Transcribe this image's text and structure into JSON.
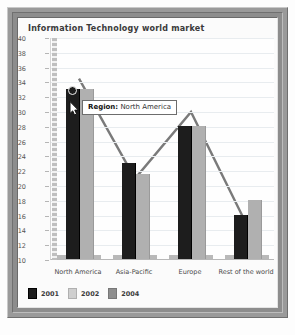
{
  "chart": {
    "title": "Information Technology world market",
    "tooltip": {
      "label": "Region:",
      "value": "North America"
    }
  },
  "legend": {
    "items": [
      {
        "label": "2001",
        "color": "#1d1d1d"
      },
      {
        "label": "2002",
        "color": "#cfcfcf"
      },
      {
        "label": "2004",
        "color": "#8e8e8e"
      }
    ]
  },
  "caption": {
    "text": ""
  },
  "chart_data": {
    "type": "bar",
    "title": "Information Technology world market",
    "xlabel": "",
    "ylabel": "",
    "ylim": [
      10,
      40
    ],
    "yticks": [
      10,
      12,
      14,
      16,
      18,
      20,
      22,
      24,
      26,
      28,
      30,
      32,
      34,
      36,
      38,
      40
    ],
    "grid": true,
    "legend_position": "bottom-left",
    "categories": [
      "North America",
      "Asia-Pacific",
      "Europe",
      "Rest of the world"
    ],
    "series": [
      {
        "name": "2001",
        "type": "bar",
        "color": "#1d1d1d",
        "values": [
          33,
          23,
          28,
          16
        ]
      },
      {
        "name": "2002",
        "type": "bar",
        "color": "#b0b0b0",
        "values": [
          33,
          21.5,
          28,
          18
        ]
      },
      {
        "name": "2004",
        "type": "line",
        "color": "#7a7a7a",
        "values": [
          34.5,
          21,
          30,
          14.7
        ]
      }
    ],
    "annotations": [
      {
        "kind": "tooltip",
        "text": "Region: North America",
        "series": "2001",
        "category": "North America"
      }
    ]
  }
}
